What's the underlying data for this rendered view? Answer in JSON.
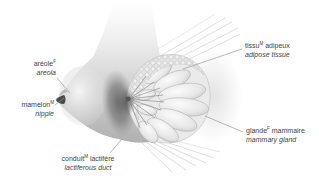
{
  "figure": {
    "colors": {
      "background": "#ffffff",
      "label_text": "#3f3f3f",
      "leader_line": "#9b9b9b",
      "skin_light": "#f2f2f2",
      "skin_dark": "#b3b3b3",
      "shadow": "#5e5e5e"
    }
  },
  "labels": {
    "areola": {
      "fr": "aréole",
      "sup": "F",
      "fr_rest": "",
      "en": "areola"
    },
    "nipple": {
      "fr": "mamelon",
      "sup": "M",
      "fr_rest": "",
      "en": "nipple"
    },
    "adipose": {
      "fr": "tissu",
      "sup": "M",
      "fr_rest": " adipeux",
      "en": "adipose tissue"
    },
    "gland": {
      "fr": "glande",
      "sup": "F",
      "fr_rest": " mammaire",
      "en": "mammary gland"
    },
    "duct": {
      "fr": "conduit",
      "sup": "M",
      "fr_rest": " lactifère",
      "en": "lactiferous duct"
    }
  }
}
